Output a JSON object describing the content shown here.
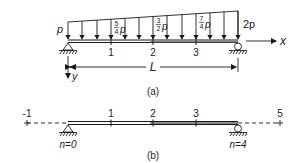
{
  "figure_a": {
    "caption": "(a)",
    "load_labels": {
      "start": "p",
      "node1_num": "5",
      "node1_den": "4",
      "node2_num": "3",
      "node2_den": "2",
      "node3_num": "7",
      "node3_den": "4",
      "var": "p",
      "end": "2p"
    },
    "node_labels": [
      "1",
      "2",
      "3"
    ],
    "x_axis_label": "x",
    "y_axis_label": "y",
    "length_label": "L"
  },
  "figure_b": {
    "caption": "(b)",
    "grid_labels": [
      "-1",
      "1",
      "2",
      "3",
      "5"
    ],
    "left_support_label": "n=0",
    "right_support_label": "n=4"
  },
  "colors": {
    "ink": "#1a1a1a",
    "background": "#ffffff"
  }
}
